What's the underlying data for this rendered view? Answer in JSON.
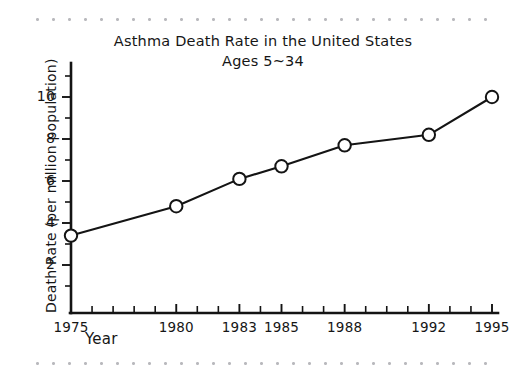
{
  "chart_data": {
    "type": "line",
    "title": "Asthma Death Rate in the United States",
    "subtitle": "Ages 5~34",
    "xlabel": "Year",
    "ylabel": "Death Rate (per million population)",
    "x": [
      1975,
      1980,
      1983,
      1985,
      1988,
      1992,
      1995
    ],
    "values": [
      3.4,
      4.8,
      6.1,
      6.7,
      7.7,
      8.2,
      10.0
    ],
    "series": [
      {
        "name": "Asthma death rate",
        "values": [
          3.4,
          4.8,
          6.1,
          6.7,
          7.7,
          8.2,
          10.0
        ]
      }
    ],
    "xlim": [
      1975,
      1995
    ],
    "ylim": [
      0,
      11.2
    ],
    "x_tick_labels": [
      "1975",
      "1980",
      "1983",
      "1985",
      "1988",
      "1992",
      "1995"
    ],
    "y_tick_labels": [
      "2",
      "4",
      "6",
      "8",
      "10"
    ],
    "y_major_ticks": [
      2,
      4,
      6,
      8,
      10
    ],
    "y_minor_ticks": [
      1,
      3,
      5,
      7,
      9,
      11
    ],
    "x_minor_ticks": [
      1976,
      1977,
      1978,
      1979,
      1981,
      1982,
      1984,
      1986,
      1987,
      1989,
      1990,
      1991,
      1993,
      1994
    ],
    "grid": false,
    "legend": "none",
    "marker": "open-circle",
    "line_color": "#141414",
    "marker_fill": "#ffffff",
    "background_color": "#ffffff",
    "style": "hand-drawn"
  },
  "decor": {
    "rule_color": "#b9b9bd",
    "rule_top_name": "dotted-rule-top",
    "rule_bottom_name": "dotted-rule-bottom"
  }
}
